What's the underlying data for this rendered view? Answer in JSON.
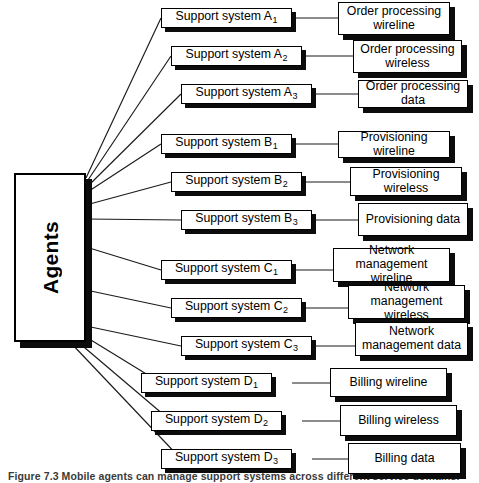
{
  "figure": {
    "caption": "Figure 7.3  Mobile agents can manage support systems across different service domains.",
    "agents_label": "Agents"
  },
  "groups": [
    {
      "id": "A",
      "support_systems": [
        {
          "label": "Support system A",
          "subscript": "1"
        },
        {
          "label": "Support system A",
          "subscript": "2"
        },
        {
          "label": "Support system A",
          "subscript": "3"
        }
      ],
      "services": [
        "Order processing\nwireline",
        "Order processing\nwireless",
        "Order processing data"
      ]
    },
    {
      "id": "B",
      "support_systems": [
        {
          "label": "Support system B",
          "subscript": "1"
        },
        {
          "label": "Support system B",
          "subscript": "2"
        },
        {
          "label": "Support system B",
          "subscript": "3"
        }
      ],
      "services": [
        "Provisioning wireline",
        "Provisioning wireless",
        "Provisioning data"
      ]
    },
    {
      "id": "C",
      "support_systems": [
        {
          "label": "Support system C",
          "subscript": "1"
        },
        {
          "label": "Support system C",
          "subscript": "2"
        },
        {
          "label": "Support system C",
          "subscript": "3"
        }
      ],
      "services": [
        "Network\nmanagement wireline",
        "Network\nmanagement wireless",
        "Network\nmanagement data"
      ]
    },
    {
      "id": "D",
      "support_systems": [
        {
          "label": "Support system D",
          "subscript": "1"
        },
        {
          "label": "Support system D",
          "subscript": "2"
        },
        {
          "label": "Support system D",
          "subscript": "3"
        }
      ],
      "services": [
        "Billing wireline",
        "Billing wireless",
        "Billing data"
      ]
    }
  ],
  "colors": {
    "stroke": "#000000",
    "shadow": "#0c0c0c",
    "fill": "#ffffff",
    "caption": "#3a3a3a"
  }
}
